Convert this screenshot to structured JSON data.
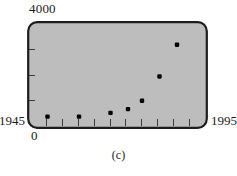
{
  "figure": {
    "caption": "(c)",
    "y_axis": {
      "top_label": "4000",
      "bottom_label": "0",
      "min": 0,
      "max": 4000,
      "tick_count": 3
    },
    "x_axis": {
      "left_label": "1945",
      "right_label": "1995",
      "min": 1945,
      "max": 1995,
      "tick_count": 10
    },
    "colors": {
      "plot_background": "#bdbdbd",
      "frame": "#1c1c1c",
      "marker": "#000000",
      "page_background": "#ffffff"
    }
  },
  "chart_data": {
    "type": "scatter",
    "title": "(c)",
    "xlabel": "",
    "ylabel": "",
    "xlim": [
      1945,
      1995
    ],
    "ylim": [
      0,
      4000
    ],
    "grid": false,
    "legend": null,
    "x": [
      1950,
      1959,
      1968,
      1973,
      1977,
      1982,
      1987
    ],
    "y": [
      330,
      330,
      480,
      630,
      960,
      1920,
      3180
    ],
    "points": [
      {
        "x": 1950,
        "y": 330
      },
      {
        "x": 1959,
        "y": 330
      },
      {
        "x": 1968,
        "y": 480
      },
      {
        "x": 1973,
        "y": 630
      },
      {
        "x": 1977,
        "y": 960
      },
      {
        "x": 1982,
        "y": 1920
      },
      {
        "x": 1987,
        "y": 3180
      }
    ],
    "marker": "filled-square",
    "tick_labels_x": [
      "1945",
      "1995"
    ],
    "tick_labels_y": [
      "0",
      "4000"
    ]
  }
}
